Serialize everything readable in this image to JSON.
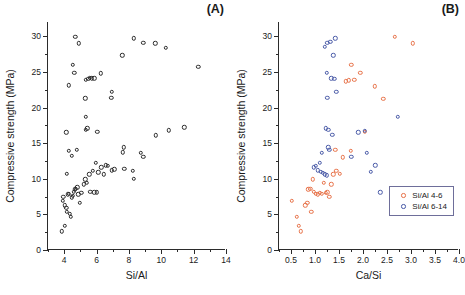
{
  "figure": {
    "background": "#ffffff",
    "panels": [
      "A",
      "B"
    ]
  },
  "colors": {
    "series_1": "#e8734a",
    "series_2": "#4a5ba8",
    "axis": "#2b2b2b",
    "marker_mono": "#2b2b2b",
    "legend_border": "#6e6e9a"
  },
  "panel_a": {
    "tag": "(A)",
    "chart_data": {
      "type": "scatter",
      "title": "",
      "xlabel": "Si/Al",
      "ylabel": "Compressive strength (MPa)",
      "xlim": [
        3.0,
        14.0
      ],
      "ylim": [
        0,
        32
      ],
      "xticks": [
        4,
        6,
        8,
        10,
        12,
        14
      ],
      "yticks": [
        0,
        5,
        10,
        15,
        20,
        25,
        30
      ],
      "xtick_labels": [
        "4",
        "6",
        "8",
        "10",
        "12",
        "14"
      ],
      "ytick_labels": [
        "0",
        "5",
        "10",
        "15",
        "20",
        "25",
        "30"
      ],
      "x_minor_interval": 1,
      "y_minor_interval": 2.5,
      "grid": false,
      "legend": "none",
      "marker": "open-circle",
      "series": [
        {
          "name": "All samples",
          "color": "#2b2b2b",
          "points": [
            [
              3.85,
              2.6
            ],
            [
              4.05,
              3.4
            ],
            [
              3.92,
              6.9
            ],
            [
              3.95,
              7.5
            ],
            [
              4.05,
              6.3
            ],
            [
              4.12,
              5.9
            ],
            [
              4.18,
              5.4
            ],
            [
              4.22,
              7.8
            ],
            [
              4.28,
              7.9
            ],
            [
              4.35,
              5.1
            ],
            [
              4.42,
              4.7
            ],
            [
              4.48,
              7.4
            ],
            [
              4.55,
              7.6
            ],
            [
              4.6,
              8.2
            ],
            [
              4.66,
              8.5
            ],
            [
              4.72,
              8.6
            ],
            [
              4.8,
              8.8
            ],
            [
              4.88,
              7.8
            ],
            [
              4.95,
              6.6
            ],
            [
              5.05,
              8.0
            ],
            [
              5.2,
              9.2
            ],
            [
              5.3,
              9.9
            ],
            [
              5.38,
              9.4
            ],
            [
              5.55,
              10.6
            ],
            [
              5.62,
              8.2
            ],
            [
              5.85,
              8.1
            ],
            [
              6.02,
              8.1
            ],
            [
              5.78,
              11.1
            ],
            [
              5.95,
              12.2
            ],
            [
              6.1,
              10.9
            ],
            [
              6.3,
              11.6
            ],
            [
              6.45,
              10.6
            ],
            [
              6.58,
              11.9
            ],
            [
              6.68,
              11.8
            ],
            [
              6.95,
              11.2
            ],
            [
              7.1,
              11.3
            ],
            [
              7.62,
              13.7
            ],
            [
              7.68,
              14.4
            ],
            [
              7.72,
              11.4
            ],
            [
              8.25,
              11.1
            ],
            [
              8.3,
              10.0
            ],
            [
              8.72,
              13.6
            ],
            [
              8.9,
              13.1
            ],
            [
              4.18,
              10.7
            ],
            [
              4.3,
              13.9
            ],
            [
              4.48,
              13.2
            ],
            [
              4.78,
              14.1
            ],
            [
              4.12,
              16.5
            ],
            [
              5.35,
              16.9
            ],
            [
              5.42,
              17.1
            ],
            [
              6.05,
              16.6
            ],
            [
              9.65,
              16.1
            ],
            [
              10.45,
              16.8
            ],
            [
              11.42,
              17.2
            ],
            [
              5.35,
              18.7
            ],
            [
              5.3,
              21.3
            ],
            [
              6.92,
              21.4
            ],
            [
              6.95,
              22.2
            ],
            [
              4.3,
              23.1
            ],
            [
              5.35,
              23.9
            ],
            [
              5.48,
              24.0
            ],
            [
              5.58,
              24.2
            ],
            [
              5.7,
              24.1
            ],
            [
              5.85,
              24.1
            ],
            [
              6.28,
              24.8
            ],
            [
              4.62,
              24.9
            ],
            [
              4.55,
              26.0
            ],
            [
              12.28,
              25.7
            ],
            [
              7.58,
              27.3
            ],
            [
              10.28,
              28.4
            ],
            [
              8.32,
              29.7
            ],
            [
              8.88,
              29.1
            ],
            [
              9.62,
              29.0
            ],
            [
              4.92,
              29.0
            ],
            [
              4.68,
              29.9
            ]
          ]
        }
      ]
    }
  },
  "panel_b": {
    "tag": "(B)",
    "chart_data": {
      "type": "scatter",
      "title": "",
      "xlabel": "Ca/Si",
      "ylabel": "Compressive strength (MPa)",
      "xlim": [
        0.25,
        4.0
      ],
      "ylim": [
        0,
        32
      ],
      "xticks": [
        0.5,
        1.0,
        1.5,
        2.0,
        2.5,
        3.0,
        3.5,
        4.0
      ],
      "yticks": [
        0,
        5,
        10,
        15,
        20,
        25,
        30
      ],
      "xtick_labels": [
        "0.5",
        "1.0",
        "1.5",
        "2.0",
        "2.5",
        "3.0",
        "3.5",
        "4.0"
      ],
      "ytick_labels": [
        "0",
        "5",
        "10",
        "15",
        "20",
        "25",
        "30"
      ],
      "x_minor_interval": 0.25,
      "y_minor_interval": 2.5,
      "grid": false,
      "legend": "lower-right",
      "marker": "open-circle",
      "series": [
        {
          "name": "Si/Al 4-6",
          "color": "#e8734a",
          "points": [
            [
              0.52,
              6.9
            ],
            [
              0.66,
              3.4
            ],
            [
              0.62,
              4.7
            ],
            [
              0.7,
              2.6
            ],
            [
              0.8,
              6.3
            ],
            [
              0.84,
              6.6
            ],
            [
              0.92,
              5.4
            ],
            [
              0.86,
              8.5
            ],
            [
              0.9,
              8.6
            ],
            [
              0.96,
              9.9
            ],
            [
              0.98,
              8.2
            ],
            [
              1.02,
              7.9
            ],
            [
              1.06,
              7.8
            ],
            [
              1.1,
              8.0
            ],
            [
              1.14,
              7.9
            ],
            [
              1.18,
              9.4
            ],
            [
              1.22,
              8.0
            ],
            [
              1.26,
              8.1
            ],
            [
              1.3,
              7.5
            ],
            [
              1.34,
              9.2
            ],
            [
              1.38,
              10.6
            ],
            [
              1.44,
              11.1
            ],
            [
              1.52,
              10.7
            ],
            [
              1.42,
              14.1
            ],
            [
              1.58,
              13.0
            ],
            [
              1.74,
              13.9
            ],
            [
              1.64,
              23.7
            ],
            [
              1.7,
              23.8
            ],
            [
              1.76,
              26.0
            ],
            [
              1.82,
              23.9
            ],
            [
              1.94,
              24.9
            ],
            [
              2.04,
              16.6
            ],
            [
              2.24,
              23.0
            ],
            [
              2.42,
              21.2
            ],
            [
              2.66,
              29.9
            ],
            [
              3.04,
              29.0
            ]
          ]
        },
        {
          "name": "Si/Al 6-14",
          "color": "#4a5ba8",
          "points": [
            [
              0.98,
              11.6
            ],
            [
              1.02,
              11.8
            ],
            [
              1.06,
              11.2
            ],
            [
              1.1,
              12.2
            ],
            [
              1.12,
              11.0
            ],
            [
              1.16,
              10.8
            ],
            [
              1.2,
              10.6
            ],
            [
              1.24,
              10.5
            ],
            [
              1.14,
              13.6
            ],
            [
              1.28,
              14.4
            ],
            [
              1.3,
              14.1
            ],
            [
              1.22,
              17.1
            ],
            [
              1.28,
              16.9
            ],
            [
              1.36,
              16.2
            ],
            [
              1.26,
              21.4
            ],
            [
              1.24,
              24.9
            ],
            [
              1.34,
              24.1
            ],
            [
              1.4,
              24.0
            ],
            [
              1.44,
              22.2
            ],
            [
              1.38,
              27.3
            ],
            [
              1.2,
              28.5
            ],
            [
              1.26,
              29.1
            ],
            [
              1.32,
              29.2
            ],
            [
              1.42,
              29.7
            ],
            [
              1.76,
              13.1
            ],
            [
              1.9,
              16.5
            ],
            [
              2.04,
              16.7
            ],
            [
              2.08,
              13.6
            ],
            [
              2.16,
              11.0
            ],
            [
              2.26,
              11.9
            ],
            [
              2.36,
              8.1
            ],
            [
              2.72,
              18.7
            ]
          ]
        }
      ]
    }
  }
}
